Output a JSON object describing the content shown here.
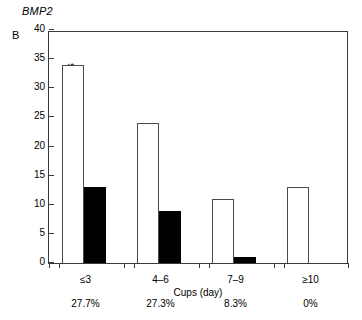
{
  "figure": {
    "gene_title": "BMP2",
    "panel_label": "B"
  },
  "chart_data": {
    "type": "bar",
    "title": "BMP2",
    "panel": "B",
    "xlabel": "Cups (day)",
    "ylabel": "No. of patients",
    "categories": [
      "≤3",
      "4–6",
      "7–9",
      "≥10"
    ],
    "series": [
      {
        "name": "open",
        "style": "white-open-bar",
        "values": [
          34,
          24,
          11,
          13
        ]
      },
      {
        "name": "filled",
        "style": "black-filled-bar",
        "values": [
          13,
          9,
          1,
          0
        ]
      }
    ],
    "annotations": {
      "label": "percent",
      "values": [
        "27.7%",
        "27.3%",
        "8.3%",
        "0%"
      ]
    },
    "ylim": [
      0,
      40
    ],
    "yticks": [
      0,
      5,
      10,
      15,
      20,
      25,
      30,
      35,
      40
    ],
    "ytick_labels": [
      "0",
      "5",
      "10",
      "15",
      "20",
      "25",
      "30",
      "35",
      "40"
    ],
    "grid": false,
    "legend": "none",
    "frame": "box"
  },
  "colors": {
    "open_bar_fill": "#ffffff",
    "open_bar_stroke": "#4a4a4a",
    "filled_bar": "#000000",
    "axis": "#3a3a3a",
    "background": "#ffffff",
    "text": "#000000"
  }
}
